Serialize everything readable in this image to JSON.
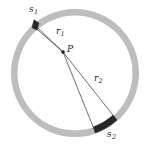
{
  "figure": {
    "type": "annulus-geometry-diagram",
    "background_color": "#ffffff",
    "ring": {
      "fill_color": "#bdbdbd",
      "center_x": 75,
      "center_y": 73,
      "outer_radius": 64,
      "inner_radius": 57.5
    },
    "point": {
      "label": "P",
      "x": 63,
      "y": 52,
      "dot_color": "#1a1a1a",
      "dot_radius": 1.8
    },
    "arcs": [
      {
        "label": "s",
        "subscript": "1",
        "color": "#262626",
        "start_angle_deg": 131,
        "end_angle_deg": 151,
        "position": "upper-left"
      },
      {
        "label": "s",
        "subscript": "2",
        "color": "#262626",
        "start_angle_deg": 311,
        "end_angle_deg": 338,
        "position": "lower-right"
      }
    ],
    "rays": [
      {
        "label": "r",
        "subscript": "1",
        "from": "P",
        "to": "s1",
        "color": "#333333",
        "stroke_width": 0.7
      },
      {
        "label": "r",
        "subscript": "2",
        "from": "P",
        "to": "s2",
        "color": "#333333",
        "stroke_width": 0.7
      }
    ],
    "labels": {
      "s1_base": "s",
      "s1_sub": "1",
      "s2_base": "s",
      "s2_sub": "2",
      "r1_base": "r",
      "r1_sub": "1",
      "r2_base": "r",
      "r2_sub": "2",
      "point_p": "P"
    }
  }
}
